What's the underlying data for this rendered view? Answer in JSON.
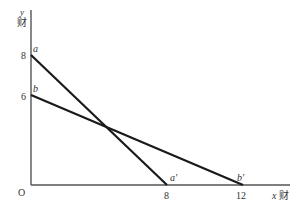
{
  "diagram": {
    "type": "production-possibility-lines",
    "axes": {
      "origin_label": "O",
      "x_label": "x财",
      "x_label_var": "x",
      "x_label_suffix": "财",
      "y_label_var": "y",
      "y_label_suffix": "财",
      "x_ticks": [
        "8",
        "12"
      ],
      "y_ticks": [
        "8",
        "6"
      ]
    },
    "lines": [
      {
        "name": "aa'",
        "start_label": "a",
        "end_label": "a′",
        "y_intercept": 8,
        "x_intercept": 8
      },
      {
        "name": "bb'",
        "start_label": "b",
        "end_label": "b′",
        "y_intercept": 6,
        "x_intercept": 12
      }
    ],
    "colors": {
      "line": "#1a1a1a",
      "axis": "#555555",
      "text": "#333333"
    }
  }
}
